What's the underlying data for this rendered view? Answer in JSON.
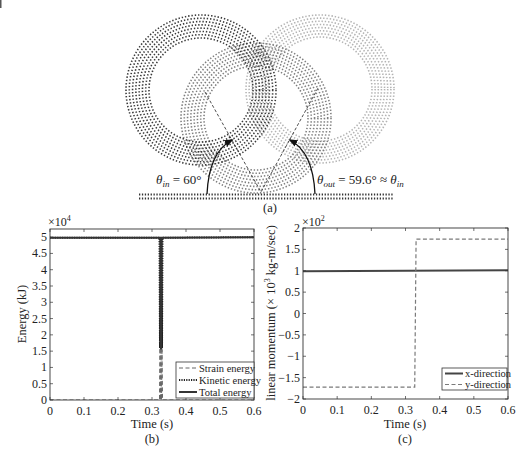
{
  "figure": {
    "panel_a": {
      "label": "(a)",
      "theta_in": {
        "symbol": "θ",
        "sub": "in",
        "rest": " = 60°"
      },
      "theta_out": {
        "symbol": "θ",
        "sub": "out",
        "rest": " = 59.6° ≈ ",
        "symbol2": "θ",
        "sub2": "in"
      }
    },
    "panel_b": {
      "label": "(b)",
      "xlabel": "Time (s)",
      "ylabel": "Energy (kJ)",
      "multiplier": "×10",
      "exponent": "4"
    },
    "panel_c": {
      "label": "(c)",
      "xlabel": "Time (s)",
      "ylabel_pre": "linear momentum (× 10",
      "ylabel_sup": "3",
      "ylabel_post": " kg-m/sec)",
      "multiplier": "×10",
      "exponent": "2"
    }
  },
  "diagram": {
    "type": "particle-ring-collision",
    "rings": [
      {
        "name": "incoming",
        "cx": 320,
        "cy": 89,
        "r_inner": 52,
        "r_outer": 74,
        "rows": 8,
        "color": "#b3b3b3"
      },
      {
        "name": "impact",
        "cx": 256,
        "cy": 118,
        "r_inner": 52,
        "r_outer": 75,
        "rows": 8,
        "color": "#7f7f7f"
      },
      {
        "name": "outgoing",
        "cx": 201,
        "cy": 90,
        "r_inner": 52,
        "r_outer": 75,
        "rows": 8,
        "color": "#3a3a3a"
      }
    ],
    "trajectory": [
      [
        205,
        92
      ],
      [
        261,
        192
      ],
      [
        318,
        88
      ]
    ],
    "wall": {
      "x1": 139,
      "x2": 394,
      "rows_y": [
        194.5,
        198.5
      ]
    },
    "arrows": [
      {
        "name": "theta-in-arc",
        "from": [
          207,
          194
        ],
        "ctrl": [
          209,
          152
        ],
        "to": [
          232,
          140
        ]
      },
      {
        "name": "theta-out-arc",
        "from": [
          315,
          194
        ],
        "ctrl": [
          313,
          152
        ],
        "to": [
          290,
          140
        ]
      }
    ],
    "incidence_angle_deg": 60,
    "reflection_angle_deg": 59.6
  },
  "chart_data": [
    {
      "id": "energy",
      "type": "line",
      "title": "",
      "xlabel": "Time (s)",
      "ylabel": "Energy (kJ)",
      "y_scale_factor": "×10^4",
      "xlim": [
        0,
        0.6
      ],
      "ylim": [
        0,
        5.25
      ],
      "xticks": [
        0,
        0.1,
        0.2,
        0.3,
        0.4,
        0.5,
        0.6
      ],
      "xtick_labels": [
        "0",
        "0.1",
        "0.2",
        "0.3",
        "0.4",
        "0.5",
        "0.6"
      ],
      "yticks": [
        0,
        0.5,
        1,
        1.5,
        2,
        2.5,
        3,
        3.5,
        4,
        4.5,
        5
      ],
      "ytick_labels": [
        "0",
        "0.5",
        "1",
        "1.5",
        "2",
        "2.5",
        "3",
        "3.5",
        "4",
        "4.5",
        "5"
      ],
      "grid": false,
      "legend_position": "lower right",
      "series": [
        {
          "name": "Strain energy",
          "style": "dashed",
          "color": "#666666",
          "width": 1,
          "x": [
            0,
            0.322,
            0.3235,
            0.325,
            0.3265,
            0.328,
            0.3295,
            0.331,
            0.6
          ],
          "y": [
            0,
            0,
            1.6,
            0,
            1.6,
            0,
            1.6,
            0,
            0
          ]
        },
        {
          "name": "Kinetic energy",
          "style": "dotted",
          "color": "#222222",
          "width": 2,
          "x": [
            0,
            0.322,
            0.3235,
            0.325,
            0.3265,
            0.328,
            0.3295,
            0.331,
            0.6
          ],
          "y": [
            4.98,
            4.98,
            1.6,
            4.98,
            1.6,
            4.98,
            1.6,
            4.98,
            5.0
          ]
        },
        {
          "name": "Total energy",
          "style": "solid",
          "color": "#333333",
          "width": 2,
          "x": [
            0,
            0.3255,
            0.3265,
            0.3275,
            0.6
          ],
          "y": [
            4.98,
            4.98,
            1.55,
            4.98,
            5.0
          ]
        }
      ]
    },
    {
      "id": "linear-momentum",
      "type": "line",
      "title": "",
      "xlabel": "Time (s)",
      "ylabel": "linear momentum (× 10^3 kg-m/sec)",
      "y_scale_factor": "×10^2",
      "xlim": [
        0,
        0.6
      ],
      "ylim": [
        -2,
        2
      ],
      "xticks": [
        0,
        0.1,
        0.2,
        0.3,
        0.4,
        0.5,
        0.6
      ],
      "xtick_labels": [
        "0",
        "0.1",
        "0.2",
        "0.3",
        "0.4",
        "0.5",
        "0.6"
      ],
      "yticks": [
        -2,
        -1.5,
        -1,
        -0.5,
        0,
        0.5,
        1,
        1.5,
        2
      ],
      "ytick_labels": [
        "−2",
        "−1.5",
        "−1",
        "−0.5",
        "0",
        "0.5",
        "1",
        "1.5",
        "2"
      ],
      "grid": false,
      "legend_position": "lower right",
      "series": [
        {
          "name": "x-direction",
          "style": "solid",
          "color": "#444444",
          "width": 2,
          "x": [
            0,
            0.6
          ],
          "y": [
            0.99,
            1.01
          ]
        },
        {
          "name": "y-direction",
          "style": "dashed",
          "color": "#7a7a7a",
          "width": 1.2,
          "x": [
            0,
            0.327,
            0.331,
            0.6
          ],
          "y": [
            -1.72,
            -1.72,
            1.74,
            1.74
          ]
        }
      ]
    }
  ]
}
